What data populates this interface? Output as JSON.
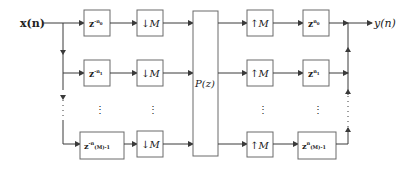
{
  "diagram": {
    "input_label": "x(n)",
    "output_label": "y(n)",
    "center_block": "P(z)",
    "rows": [
      {
        "delay_in": {
          "base": "z",
          "exp": "-n",
          "sub": "0"
        },
        "down": "↓M",
        "up": "↑M",
        "delay_out": {
          "base": "z",
          "exp": "n",
          "sub": "0"
        }
      },
      {
        "delay_in": {
          "base": "z",
          "exp": "-n",
          "sub": "1"
        },
        "down": "↓M",
        "up": "↑M",
        "delay_out": {
          "base": "z",
          "exp": "n",
          "sub": "1"
        }
      },
      {
        "delay_in": {
          "base": "z",
          "exp": "-n",
          "sub": "(M)-1"
        },
        "down": "↓M",
        "up": "↑M",
        "delay_out": {
          "base": "z",
          "exp": "n",
          "sub": "(M)-1"
        }
      }
    ],
    "ellipsis": "⋮",
    "colors": {
      "box_stroke": "#6a6a6a",
      "wire": "#3a3a3a",
      "text": "#222222"
    }
  }
}
